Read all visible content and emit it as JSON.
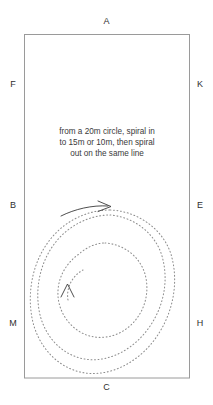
{
  "figure": {
    "title_letters_note": "dressage arena marker letters",
    "arena": {
      "border_color": "#9a9a9a",
      "fill_color": "#ffffff"
    },
    "markers": {
      "top": "A",
      "bottom": "C",
      "left": [
        "F",
        "B",
        "M"
      ],
      "right": [
        "K",
        "E",
        "H"
      ]
    },
    "instruction": {
      "line1": "from a 20m circle, spiral in",
      "line2": "to 15m or 10m, then spiral",
      "line3": "out on the same line"
    },
    "path": {
      "style": "dotted",
      "color": "#8d8d8d",
      "entry_arrow_color": "#3a3a3a",
      "inner_arrow_color": "#3a3a3a",
      "description": "inward spiral with entry arrow at top and direction chevron near centre"
    }
  }
}
